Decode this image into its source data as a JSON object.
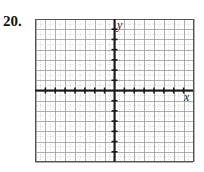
{
  "problem": {
    "number": "20."
  },
  "chart_data": {
    "type": "line",
    "title": "",
    "xlabel": "x",
    "ylabel": "y",
    "grid": true,
    "xlim": [
      -8,
      8
    ],
    "ylim": [
      -7,
      7
    ],
    "x_ticks": [
      -7,
      -6,
      -5,
      -4,
      -3,
      -2,
      -1,
      1,
      2,
      3,
      4,
      5,
      6,
      7
    ],
    "y_ticks": [
      -6,
      -5,
      -4,
      -3,
      -2,
      -1,
      1,
      2,
      3,
      4,
      5,
      6
    ],
    "series": []
  },
  "colors": {
    "axis": "#1a1a1a",
    "grid_major": "#9a9a9a",
    "grid_minor": "#c4c4c4",
    "frame": "#555555"
  }
}
